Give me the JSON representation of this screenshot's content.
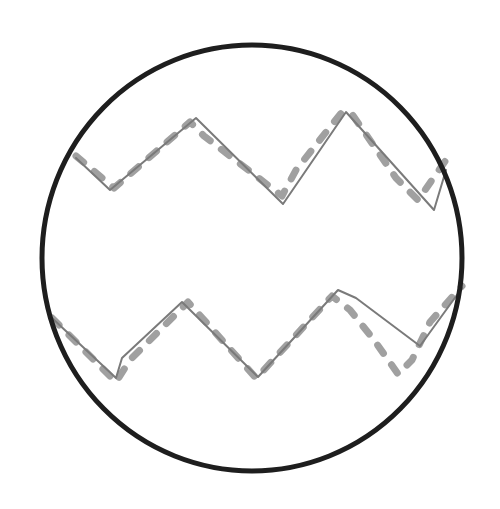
{
  "diagram": {
    "type": "sketch",
    "colors": {
      "background": "#ffffff",
      "circle": "#1e1e1e",
      "solid_line": "#7a7a7a",
      "dashed_line": "#a0a0a0"
    },
    "circle": {
      "cx": 252,
      "cy": 258,
      "r": 210,
      "stroke_width": 5
    },
    "waves": [
      {
        "name": "upper-wave",
        "solid_points": [
          [
            76,
            158
          ],
          [
            110,
            190
          ],
          [
            196,
            118
          ],
          [
            283,
            204
          ],
          [
            346,
            112
          ],
          [
            434,
            210
          ],
          [
            446,
            170
          ]
        ],
        "dashed_points": [
          [
            76,
            156
          ],
          [
            114,
            188
          ],
          [
            190,
            122
          ],
          [
            204,
            136
          ],
          [
            282,
            196
          ],
          [
            296,
            170
          ],
          [
            342,
            112
          ],
          [
            352,
            114
          ],
          [
            396,
            178
          ],
          [
            418,
            200
          ],
          [
            446,
            160
          ]
        ]
      },
      {
        "name": "lower-wave",
        "solid_points": [
          [
            52,
            318
          ],
          [
            116,
            378
          ],
          [
            122,
            358
          ],
          [
            182,
            302
          ],
          [
            258,
            377
          ],
          [
            338,
            290
          ],
          [
            356,
            298
          ],
          [
            420,
            346
          ],
          [
            462,
            288
          ]
        ],
        "dashed_points": [
          [
            52,
            318
          ],
          [
            116,
            382
          ],
          [
            130,
            360
          ],
          [
            188,
            302
          ],
          [
            256,
            378
          ],
          [
            262,
            372
          ],
          [
            332,
            296
          ],
          [
            350,
            310
          ],
          [
            374,
            340
          ],
          [
            398,
            374
          ],
          [
            412,
            360
          ],
          [
            430,
            322
          ],
          [
            462,
            286
          ]
        ]
      }
    ]
  }
}
